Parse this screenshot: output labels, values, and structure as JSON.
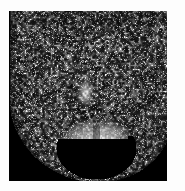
{
  "view": {
    "width": 185,
    "height": 191,
    "page_background": "#fdfdfd",
    "title": "Grayscale medical scan"
  },
  "scan": {
    "name": "axial-grayscale-scan",
    "modality_appearance": "MRI-like grayscale cross-section",
    "frame": {
      "x": 9,
      "y": 11,
      "width": 158,
      "height": 170
    },
    "background_color": "#000000",
    "colormap": "grayscale",
    "intensity_range": [
      0,
      255
    ],
    "notes": "No overlay text, rulers, annotations or UI chrome are visible in the image."
  },
  "regions": [
    {
      "name": "upper-speckled-tissue",
      "label": "Upper textured tissue field",
      "center": [
        80,
        55
      ],
      "mean_intensity": 42,
      "peak_intensity": 210,
      "description": "Dense high-frequency speckle, dark overall with scattered bright flecks"
    },
    {
      "name": "central-bright-structure",
      "label": "Central bright vertical structure",
      "center": [
        85,
        92
      ],
      "mean_intensity": 150,
      "peak_intensity": 235,
      "description": "Elongated bright band running vertically near image center"
    },
    {
      "name": "lower-rounded-mass",
      "label": "Lower rounded bilobed bright mass",
      "center": [
        96,
        148
      ],
      "mean_intensity": 120,
      "peak_intensity": 245,
      "description": "Hemispherical bright region with two lobes and internal reticular texture"
    },
    {
      "name": "left-body-contour",
      "label": "Left curved body contour",
      "center": [
        30,
        140
      ],
      "mean_intensity": 15,
      "peak_intensity": 120,
      "description": "Sloping dark boundary falling away to black at lower left"
    },
    {
      "name": "right-body-contour",
      "label": "Right curved body contour",
      "center": [
        148,
        140
      ],
      "mean_intensity": 15,
      "peak_intensity": 160,
      "description": "Sloping dark boundary falling away to black at lower right"
    }
  ],
  "palette": {
    "black": "#000000",
    "dark_gray": "#1b1b1b",
    "mid_gray": "#6e6e6e",
    "light_gray": "#c8c8c8",
    "white": "#ffffff",
    "page": "#fdfdfd"
  }
}
